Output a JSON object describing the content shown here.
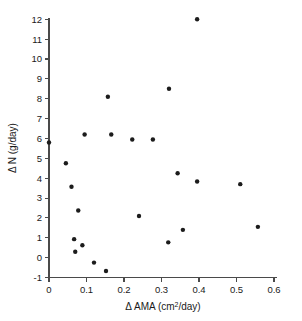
{
  "chart_data": {
    "type": "scatter",
    "title": "",
    "xlabel": "Δ AMA (cm2/day)",
    "ylabel": "Δ N (g/day)",
    "xlim": [
      0,
      0.6
    ],
    "ylim": [
      -1,
      12
    ],
    "grid": false,
    "legend": null,
    "xticks": [
      "0",
      "0.1",
      "0.2",
      "0.3",
      "0.4",
      "0.5",
      "0.6"
    ],
    "xtick_values": [
      0,
      0.1,
      0.2,
      0.3,
      0.4,
      0.5,
      0.6
    ],
    "yticks": [
      "-1",
      "0",
      "1",
      "2",
      "3",
      "4",
      "5",
      "6",
      "7",
      "8",
      "9",
      "10",
      "11",
      "12"
    ],
    "ytick_values": [
      -1,
      0,
      1,
      2,
      3,
      4,
      5,
      6,
      7,
      8,
      9,
      10,
      11,
      12
    ],
    "marker": "filled-circle",
    "marker_color": "#1c1c1c",
    "points": [
      {
        "x": 0.0,
        "y": 5.8
      },
      {
        "x": 0.045,
        "y": 4.75
      },
      {
        "x": 0.06,
        "y": 3.57
      },
      {
        "x": 0.067,
        "y": 0.93
      },
      {
        "x": 0.07,
        "y": 0.3
      },
      {
        "x": 0.078,
        "y": 2.37
      },
      {
        "x": 0.089,
        "y": 0.62
      },
      {
        "x": 0.095,
        "y": 6.2
      },
      {
        "x": 0.12,
        "y": -0.25
      },
      {
        "x": 0.152,
        "y": -0.67
      },
      {
        "x": 0.157,
        "y": 8.1
      },
      {
        "x": 0.166,
        "y": 6.2
      },
      {
        "x": 0.222,
        "y": 5.95
      },
      {
        "x": 0.24,
        "y": 2.1
      },
      {
        "x": 0.277,
        "y": 5.95
      },
      {
        "x": 0.318,
        "y": 0.77
      },
      {
        "x": 0.32,
        "y": 8.5
      },
      {
        "x": 0.343,
        "y": 4.25
      },
      {
        "x": 0.357,
        "y": 1.4
      },
      {
        "x": 0.395,
        "y": 12.0
      },
      {
        "x": 0.395,
        "y": 3.83
      },
      {
        "x": 0.51,
        "y": 3.7
      },
      {
        "x": 0.557,
        "y": 1.55
      }
    ]
  },
  "axis_titles": {
    "x_delta": "Δ",
    "x_main": "AMA (cm",
    "x_sup": "2",
    "x_tail": "/day)",
    "y_delta": "Δ",
    "y_main": "N (g/day)"
  },
  "colors": {
    "marker": "#1c1c1c",
    "axis": "#4a4a4a",
    "text": "#1a1a1a",
    "background": "#ffffff"
  }
}
